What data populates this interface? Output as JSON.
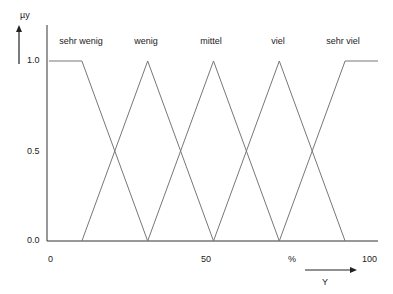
{
  "chart_data": {
    "type": "line",
    "title": "",
    "ylabel": "µy",
    "xlabel": "Y",
    "x_unit": "%",
    "xlim": [
      0,
      100
    ],
    "ylim": [
      0,
      1
    ],
    "x_ticks": [
      "0",
      "50",
      "%",
      "100"
    ],
    "y_ticks": [
      "0.0",
      "0.5",
      "1.0"
    ],
    "grid": false,
    "legend_position": "top (labels above each membership function)",
    "series": [
      {
        "name": "sehr wenig",
        "x": [
          0,
          10,
          30
        ],
        "y": [
          1,
          1,
          0
        ]
      },
      {
        "name": "wenig",
        "x": [
          10,
          30,
          50
        ],
        "y": [
          0,
          1,
          0
        ]
      },
      {
        "name": "mittel",
        "x": [
          30,
          50,
          70
        ],
        "y": [
          0,
          1,
          0
        ]
      },
      {
        "name": "viel",
        "x": [
          50,
          70,
          90
        ],
        "y": [
          0,
          1,
          0
        ]
      },
      {
        "name": "sehr viel",
        "x": [
          70,
          90,
          100
        ],
        "y": [
          0,
          1,
          1
        ]
      }
    ]
  },
  "labels": {
    "y_axis": "µy",
    "x_axis": "Y",
    "sets": [
      "sehr wenig",
      "wenig",
      "mittel",
      "viel",
      "sehr viel"
    ],
    "y_ticks": [
      "1.0",
      "0.5",
      "0.0"
    ],
    "x_ticks": [
      "0",
      "50",
      "%",
      "100"
    ]
  }
}
